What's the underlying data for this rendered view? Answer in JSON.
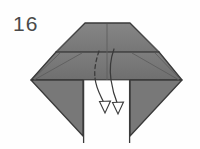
{
  "figure": {
    "kind": "origami-fold-diagram",
    "step_label": "16",
    "background_color": "#fefefe"
  },
  "colors": {
    "paper_fill": "#7c7c7c",
    "paper_fill_light": "#868686",
    "paper_fill_dark": "#6f6f6f",
    "outline": "#3a3a3a",
    "crease_line": "#5d5d5d",
    "arrow_line": "#3a3a3a",
    "label_text": "#4a4a4a",
    "notch_fill": "#fefefe"
  },
  "shapes": {
    "top_trapezoid": {
      "name": "top-flap",
      "points": "85,23 130,23 159,52 56,52"
    },
    "middle_band": {
      "name": "middle-band",
      "points": "56,52 159,52 182,80 31,80"
    },
    "left_bottom_triangle": {
      "name": "left-lower-flap",
      "points": "31,80 83,80 83,135 31,80"
    },
    "right_bottom_triangle": {
      "name": "right-lower-flap",
      "points": "182,80 130,80 130,135 182,80"
    },
    "left_notch_wall": {
      "name": "left-notch-wall",
      "line": "83,80 83,143"
    },
    "right_notch_wall": {
      "name": "right-notch-wall",
      "line": "130,80 130,143"
    }
  },
  "creases": [
    {
      "name": "crease-horizontal-mid",
      "line": "56,52 159,52",
      "style": "solid"
    },
    {
      "name": "crease-vertical-center-top",
      "line": "107,23 107,80",
      "style": "solid"
    },
    {
      "name": "crease-diagonal-left-upper",
      "line": "85,23 56,52",
      "style": "solid"
    },
    {
      "name": "crease-diagonal-right-upper",
      "line": "130,23 159,52",
      "style": "solid"
    },
    {
      "name": "crease-diagonal-left-lower",
      "line": "31,80 59,52",
      "style": "solid"
    },
    {
      "name": "crease-diagonal-right-lower",
      "line": "182,80 156,52",
      "style": "solid"
    },
    {
      "name": "crease-diagonal-left-inner",
      "line": "35,80 83,52",
      "style": "solid"
    },
    {
      "name": "crease-diagonal-right-inner",
      "line": "178,80 131,52",
      "style": "solid"
    }
  ],
  "arrows": [
    {
      "name": "fold-arrow-left",
      "hidden_segment_style": "dashed",
      "visible_segment_style": "solid",
      "path_hidden": "M 99,52 C 96,60 94,68 95,78",
      "path_visible": "M 95,78 C 96,88 101,96 104,103",
      "arrowhead": "hollow-triangle",
      "arrowhead_points": "99,102 111,102 105,114",
      "direction": "down"
    },
    {
      "name": "fold-arrow-right",
      "hidden_segment_style": "solid",
      "visible_segment_style": "solid",
      "path_hidden": "M 114,50 C 111,60 110,70 111,79",
      "path_visible": "M 111,79 C 112,89 115,97 117,104",
      "arrowhead": "hollow-triangle",
      "arrowhead_points": "112,103 124,103 118,115",
      "direction": "down"
    }
  ]
}
